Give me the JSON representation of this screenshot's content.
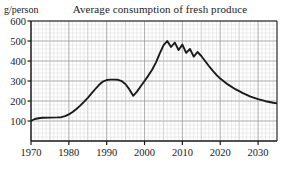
{
  "chart_data": {
    "type": "line",
    "title": "Average consumption of fresh produce",
    "ylabel": "g/person",
    "xlabel": "",
    "xlim": [
      1970,
      2035
    ],
    "ylim": [
      0,
      600
    ],
    "grid": true,
    "grid_minor": true,
    "legend": "none",
    "yticks": [
      100,
      200,
      300,
      400,
      500,
      600
    ],
    "ytick_labels": [
      "100",
      "200",
      "300",
      "400",
      "500",
      "600"
    ],
    "xticks": [
      1970,
      1980,
      1990,
      2000,
      2010,
      2020,
      2030
    ],
    "xtick_labels": [
      "1970",
      "1980",
      "1990",
      "2000",
      "2010",
      "2020",
      "2030"
    ],
    "series": [
      {
        "name": "Average consumption of fresh produce",
        "color": "#1a1a1a",
        "x": [
          1970,
          1971,
          1972,
          1973,
          1975,
          1977,
          1978,
          1979,
          1980,
          1981,
          1982,
          1983,
          1984,
          1985,
          1986,
          1987,
          1988,
          1989,
          1990,
          1991,
          1992,
          1993,
          1994,
          1995,
          1996,
          1997,
          1998,
          1999,
          2000,
          2001,
          2002,
          2003,
          2004,
          2005,
          2006,
          2007,
          2008,
          2009,
          2010,
          2011,
          2012,
          2013,
          2014,
          2015,
          2016,
          2017,
          2018,
          2019,
          2020,
          2022,
          2024,
          2026,
          2028,
          2030,
          2032,
          2034,
          2035
        ],
        "y": [
          100,
          110,
          114,
          116,
          117,
          118,
          119,
          124,
          133,
          145,
          160,
          177,
          196,
          216,
          238,
          260,
          281,
          297,
          305,
          307,
          307,
          306,
          299,
          284,
          258,
          226,
          247,
          274,
          300,
          327,
          356,
          392,
          437,
          478,
          500,
          470,
          492,
          455,
          482,
          441,
          460,
          422,
          445,
          425,
          400,
          375,
          352,
          331,
          312,
          283,
          259,
          239,
          222,
          209,
          199,
          191,
          188
        ]
      }
    ]
  },
  "axes": {
    "tick_color": "#1a1a1a",
    "grid_major_color": "#9a9a9a",
    "grid_minor_color": "#d8d8d8",
    "frame_color": "#1a1a1a"
  }
}
